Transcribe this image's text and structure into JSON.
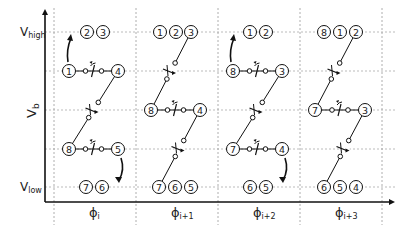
{
  "axes": {
    "y_label": "V",
    "y_label_sub": "b",
    "levels": [
      {
        "label": "V",
        "sub": "high",
        "y": 32
      },
      {
        "label": "",
        "sub": "",
        "y": 71
      },
      {
        "label": "",
        "sub": "",
        "y": 110
      },
      {
        "label": "",
        "sub": "",
        "y": 149
      },
      {
        "label": "V",
        "sub": "low",
        "y": 187
      }
    ],
    "phases": [
      {
        "label": "ϕ",
        "sub": "i",
        "x": 95
      },
      {
        "label": "ϕ",
        "sub": "i+1",
        "x": 177
      },
      {
        "label": "ϕ",
        "sub": "i+2",
        "x": 259
      },
      {
        "label": "ϕ",
        "sub": "i+3",
        "x": 341
      }
    ]
  },
  "panels": [
    {
      "phase": "ϕi",
      "nodes": [
        {
          "n": "2",
          "x": 87,
          "y": 32
        },
        {
          "n": "3",
          "x": 103,
          "y": 32
        },
        {
          "n": "1",
          "x": 69,
          "y": 71
        },
        {
          "n": "4",
          "x": 118,
          "y": 71
        },
        {
          "n": "8",
          "x": 69,
          "y": 149
        },
        {
          "n": "5",
          "x": 118,
          "y": 149
        },
        {
          "n": "7",
          "x": 86,
          "y": 187
        },
        {
          "n": "6",
          "x": 102,
          "y": 187
        }
      ],
      "h_switches": [
        {
          "x1": 69,
          "x2": 118,
          "y": 71
        },
        {
          "x1": 69,
          "x2": 118,
          "y": 149
        }
      ],
      "d_switches": [
        {
          "x1": 118,
          "y1": 71,
          "x2": 69,
          "y2": 149
        }
      ],
      "arrows": [
        {
          "dir": "up",
          "x": 68,
          "y1": 62,
          "y2": 38
        },
        {
          "dir": "down",
          "x": 121,
          "y1": 158,
          "y2": 180
        }
      ]
    },
    {
      "phase": "ϕi+1",
      "nodes": [
        {
          "n": "1",
          "x": 160,
          "y": 32
        },
        {
          "n": "2",
          "x": 176,
          "y": 32
        },
        {
          "n": "3",
          "x": 191,
          "y": 32
        },
        {
          "n": "8",
          "x": 151,
          "y": 110
        },
        {
          "n": "4",
          "x": 200,
          "y": 110
        },
        {
          "n": "7",
          "x": 159,
          "y": 187
        },
        {
          "n": "6",
          "x": 175,
          "y": 187
        },
        {
          "n": "5",
          "x": 191,
          "y": 187
        }
      ],
      "h_switches": [
        {
          "x1": 151,
          "x2": 200,
          "y": 110
        }
      ],
      "d_switches": [
        {
          "x1": 191,
          "y1": 32,
          "x2": 151,
          "y2": 110
        },
        {
          "x1": 200,
          "y1": 110,
          "x2": 159,
          "y2": 187
        }
      ],
      "arrows": []
    },
    {
      "phase": "ϕi+2",
      "nodes": [
        {
          "n": "1",
          "x": 250,
          "y": 32
        },
        {
          "n": "2",
          "x": 266,
          "y": 32
        },
        {
          "n": "8",
          "x": 233,
          "y": 71
        },
        {
          "n": "3",
          "x": 282,
          "y": 71
        },
        {
          "n": "7",
          "x": 233,
          "y": 149
        },
        {
          "n": "4",
          "x": 282,
          "y": 149
        },
        {
          "n": "6",
          "x": 250,
          "y": 187
        },
        {
          "n": "5",
          "x": 266,
          "y": 187
        }
      ],
      "h_switches": [
        {
          "x1": 233,
          "x2": 282,
          "y": 71
        },
        {
          "x1": 233,
          "x2": 282,
          "y": 149
        }
      ],
      "d_switches": [
        {
          "x1": 282,
          "y1": 71,
          "x2": 233,
          "y2": 149
        }
      ],
      "arrows": [
        {
          "dir": "up",
          "x": 231,
          "y1": 62,
          "y2": 38
        },
        {
          "dir": "down",
          "x": 285,
          "y1": 158,
          "y2": 180
        }
      ]
    },
    {
      "phase": "ϕi+3",
      "nodes": [
        {
          "n": "8",
          "x": 324,
          "y": 32
        },
        {
          "n": "1",
          "x": 340,
          "y": 32
        },
        {
          "n": "2",
          "x": 356,
          "y": 32
        },
        {
          "n": "7",
          "x": 315,
          "y": 110
        },
        {
          "n": "3",
          "x": 365,
          "y": 110
        },
        {
          "n": "6",
          "x": 324,
          "y": 187
        },
        {
          "n": "5",
          "x": 340,
          "y": 187
        },
        {
          "n": "4",
          "x": 356,
          "y": 187
        }
      ],
      "h_switches": [
        {
          "x1": 315,
          "x2": 365,
          "y": 110
        }
      ],
      "d_switches": [
        {
          "x1": 356,
          "y1": 32,
          "x2": 315,
          "y2": 110
        },
        {
          "x1": 365,
          "y1": 110,
          "x2": 324,
          "y2": 187
        }
      ],
      "arrows": []
    }
  ]
}
